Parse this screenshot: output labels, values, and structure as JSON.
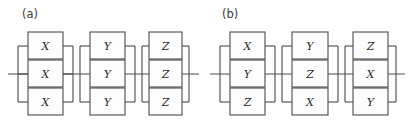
{
  "figure": {
    "type": "quantum-circuit-diagram",
    "background_color": "#ffffff",
    "line_color": "#4a4a4a",
    "box_fill_color": "#fdfdfd",
    "label_color": "#3a3a3a"
  },
  "panels": [
    {
      "label": "(a)",
      "blocks": [
        {
          "gates": [
            "X",
            "X",
            "X"
          ]
        },
        {
          "gates": [
            "Y",
            "Y",
            "Y"
          ]
        },
        {
          "gates": [
            "Z",
            "Z",
            "Z"
          ]
        }
      ]
    },
    {
      "label": "(b)",
      "blocks": [
        {
          "gates": [
            "X",
            "Y",
            "Z"
          ]
        },
        {
          "gates": [
            "Y",
            "Z",
            "X"
          ]
        },
        {
          "gates": [
            "Z",
            "X",
            "Y"
          ]
        }
      ]
    }
  ]
}
